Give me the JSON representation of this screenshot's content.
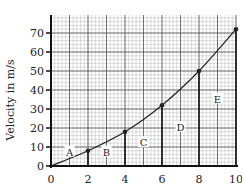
{
  "chart_data": {
    "type": "line",
    "title": "",
    "xlabel": "",
    "ylabel": "Velocity in m/s",
    "xlim": [
      0,
      10
    ],
    "ylim": [
      0,
      75
    ],
    "grid": true,
    "x_ticks": [
      0,
      2,
      4,
      6,
      8,
      10
    ],
    "y_ticks": [
      0,
      10,
      20,
      30,
      40,
      50,
      60,
      70
    ],
    "series": [
      {
        "name": "velocity",
        "x": [
          0,
          2,
          4,
          6,
          8,
          10
        ],
        "values": [
          0,
          8,
          18,
          32,
          50,
          72
        ],
        "markers": true
      }
    ],
    "vertical_lines_at_x": [
      2,
      4,
      6,
      8,
      10
    ],
    "region_labels": [
      {
        "text": "A",
        "x": 1,
        "y": 7
      },
      {
        "text": "B",
        "x": 3,
        "y": 7
      },
      {
        "text": "C",
        "x": 5,
        "y": 12
      },
      {
        "text": "D",
        "x": 7,
        "y": 20
      },
      {
        "text": "E",
        "x": 9,
        "y": 35
      }
    ],
    "legend": null
  },
  "colors": {
    "grid_minor": "#b8b8b8",
    "grid_major": "#555555",
    "axis": "#111111",
    "curve": "#222222",
    "text": "#222222"
  }
}
